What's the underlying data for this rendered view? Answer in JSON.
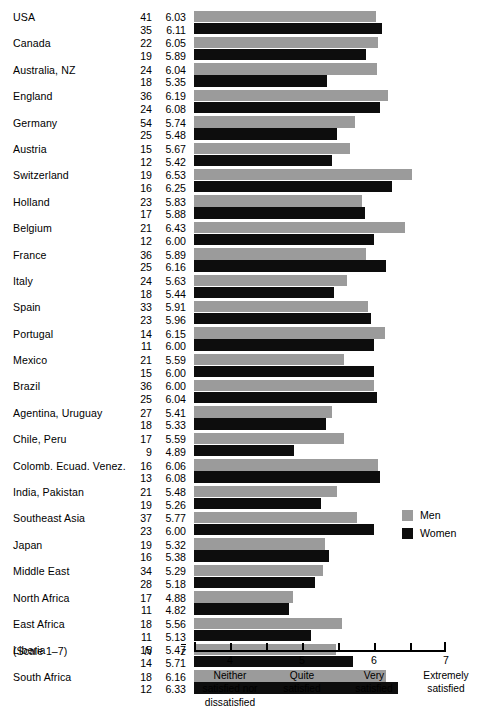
{
  "chart_data": {
    "type": "bar",
    "title": "",
    "xlabel": "",
    "ylabel": "",
    "xlim": [
      3.5,
      7
    ],
    "grid": false,
    "orientation": "horizontal",
    "scale_note": "(Scale 1–7)",
    "column_headers": {
      "n": "N",
      "mean": "z̄"
    },
    "legend": {
      "position": "right",
      "entries": [
        {
          "name": "Men",
          "color": "#9b9b9b"
        },
        {
          "name": "Women",
          "color": "#0d0d0d"
        }
      ]
    },
    "axis": {
      "ticks_major": [
        {
          "value": 4,
          "label": "4",
          "desc": "Neither\nsatisfied nor\ndissatisfied"
        },
        {
          "value": 5,
          "label": "5",
          "desc": "Quite\nsatisfied"
        },
        {
          "value": 6,
          "label": "6",
          "desc": "Very\nsatisfied"
        },
        {
          "value": 7,
          "label": "7",
          "desc": "Extremely\nsatisfied"
        }
      ],
      "ticks_minor": [
        4.5,
        5.5,
        6.5
      ]
    },
    "categories": [
      "USA",
      "Canada",
      "Australia, NZ",
      "England",
      "Germany",
      "Austria",
      "Switzerland",
      "Holland",
      "Belgium",
      "France",
      "Italy",
      "Spain",
      "Portugal",
      "Mexico",
      "Brazil",
      "Agentina, Uruguay",
      "Chile, Peru",
      "Colomb. Ecuad. Venez.",
      "India, Pakistan",
      "Southeast Asia",
      "Japan",
      "Middle East",
      "North Africa",
      "East Africa",
      "Liberia",
      "South Africa"
    ],
    "series": [
      {
        "name": "Men",
        "color": "#9b9b9b",
        "n": [
          41,
          22,
          24,
          36,
          54,
          15,
          19,
          23,
          21,
          36,
          24,
          33,
          14,
          21,
          36,
          27,
          17,
          16,
          21,
          37,
          19,
          34,
          17,
          18,
          15,
          18
        ],
        "values": [
          6.03,
          6.05,
          6.04,
          6.19,
          5.74,
          5.67,
          6.53,
          5.83,
          6.43,
          5.89,
          5.63,
          5.91,
          6.15,
          5.59,
          6.0,
          5.41,
          5.59,
          6.06,
          5.48,
          5.77,
          5.32,
          5.29,
          4.88,
          5.56,
          5.47,
          6.16
        ]
      },
      {
        "name": "Women",
        "color": "#0d0d0d",
        "n": [
          35,
          19,
          18,
          24,
          25,
          12,
          16,
          17,
          12,
          25,
          18,
          23,
          11,
          15,
          25,
          18,
          9,
          13,
          19,
          23,
          16,
          28,
          11,
          11,
          14,
          12
        ],
        "values": [
          6.11,
          5.89,
          5.35,
          6.08,
          5.48,
          5.42,
          6.25,
          5.88,
          6.0,
          6.16,
          5.44,
          5.96,
          6.0,
          6.0,
          6.04,
          5.33,
          4.89,
          6.08,
          5.26,
          6.0,
          5.38,
          5.18,
          4.82,
          5.13,
          5.71,
          6.33
        ]
      }
    ]
  }
}
